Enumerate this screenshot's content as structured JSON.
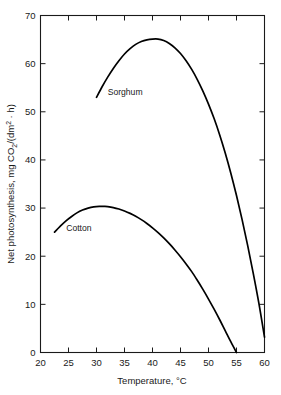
{
  "chart_data": {
    "type": "line",
    "title": "",
    "xlabel": "Temperature, °C",
    "ylabel": "Net photosynthesis, mg CO2/(dm2 · h)",
    "ylabel_parts": {
      "prefix": "Net photosynthesis, mg CO",
      "sub_co2": "2",
      "mid": "/(dm",
      "sup_dm": "2",
      "suffix": " · h)"
    },
    "xlim": [
      20,
      60
    ],
    "ylim": [
      0,
      70
    ],
    "xticks": [
      20,
      25,
      30,
      35,
      40,
      45,
      50,
      55,
      60
    ],
    "xtick_labels": [
      "20",
      "25",
      "30",
      "35",
      "40",
      "45",
      "50",
      "55",
      "60"
    ],
    "yticks": [
      0,
      10,
      20,
      30,
      40,
      50,
      60,
      70
    ],
    "ytick_labels": [
      "0",
      "10",
      "20",
      "30",
      "40",
      "50",
      "60",
      "70"
    ],
    "grid": false,
    "legend_position": "inline-annotation",
    "line_color": "#000000",
    "axis_color": "#1a1a1a",
    "background": "#ffffff",
    "series": [
      {
        "name": "Sorghum",
        "label": "Sorghum",
        "label_x": 32.0,
        "label_y": 53.5,
        "x": [
          30.0,
          31.0,
          32.0,
          33.0,
          34.0,
          35.0,
          36.0,
          37.0,
          38.0,
          39.0,
          40.0,
          41.0,
          42.0,
          43.0,
          44.0,
          45.0,
          46.0,
          47.0,
          48.0,
          49.0,
          50.0,
          51.0,
          52.0,
          53.0,
          54.0,
          55.0,
          56.0,
          57.0,
          58.0,
          59.0,
          60.0
        ],
        "y": [
          53.0,
          55.2,
          57.2,
          59.0,
          60.6,
          62.0,
          63.1,
          64.0,
          64.6,
          64.95,
          65.1,
          65.1,
          64.8,
          64.2,
          63.3,
          62.1,
          60.6,
          58.8,
          56.7,
          54.3,
          51.6,
          48.6,
          45.2,
          41.4,
          37.2,
          32.6,
          27.6,
          22.2,
          16.4,
          10.2,
          3.2
        ]
      },
      {
        "name": "Cotton",
        "label": "Cotton",
        "label_x": 24.6,
        "label_y": 25.3,
        "x": [
          22.5,
          23.5,
          24.5,
          25.5,
          26.5,
          27.5,
          28.5,
          29.5,
          30.5,
          31.5,
          32.0,
          33.0,
          34.0,
          35.0,
          36.0,
          37.0,
          38.0,
          39.0,
          40.0,
          41.0,
          42.0,
          43.0,
          44.0,
          45.0,
          46.0,
          47.0,
          48.0,
          49.0,
          50.0,
          51.0,
          52.0,
          53.0,
          54.0,
          55.0
        ],
        "y": [
          25.0,
          26.2,
          27.3,
          28.2,
          29.0,
          29.6,
          30.0,
          30.25,
          30.35,
          30.35,
          30.3,
          30.1,
          29.8,
          29.4,
          28.9,
          28.3,
          27.6,
          26.8,
          25.9,
          24.9,
          23.8,
          22.6,
          21.3,
          19.9,
          18.4,
          16.8,
          15.0,
          13.1,
          11.1,
          9.0,
          6.8,
          4.5,
          2.2,
          0.0
        ]
      }
    ]
  }
}
